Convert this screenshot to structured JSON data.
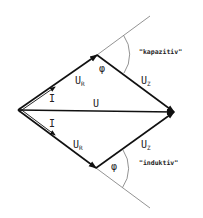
{
  "diagram": {
    "type": "phasor-diagram",
    "vectors": {
      "U": {
        "symbol": "U",
        "subscript": ""
      },
      "U_R_upper": {
        "symbol": "U",
        "subscript": "R"
      },
      "U_R_lower": {
        "symbol": "U",
        "subscript": "R"
      },
      "U_Z_upper": {
        "symbol": "U",
        "subscript": "Z"
      },
      "U_Z_lower": {
        "symbol": "U",
        "subscript": "Z"
      },
      "I_upper": {
        "symbol": "I"
      },
      "I_lower": {
        "symbol": "I"
      }
    },
    "angles": {
      "upper": "φ",
      "lower": "φ"
    },
    "annotations": {
      "upper": "\"kapazitiv\"",
      "lower": "\"induktiv\""
    },
    "colors": {
      "stroke": "#111111",
      "thin": "#888888"
    }
  }
}
